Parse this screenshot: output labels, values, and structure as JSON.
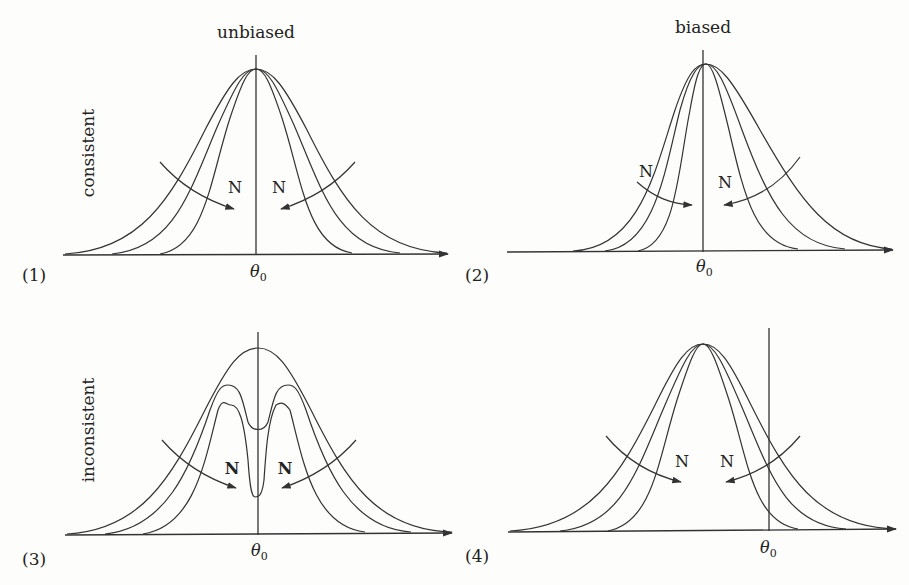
{
  "columns": {
    "left": "unbiased",
    "right": "biased"
  },
  "rows": {
    "top": "consistent",
    "bottom": "inconsistent"
  },
  "panels": [
    {
      "id": "(1)",
      "x_label": "θ",
      "x_sub": "0",
      "left_arrow_label": "N",
      "right_arrow_label": "N",
      "description": "unbiased, consistent: symmetric curves centered at θ0 narrowing as N increases"
    },
    {
      "id": "(2)",
      "x_label": "θ",
      "x_sub": "0",
      "left_arrow_label": "N",
      "right_arrow_label": "N",
      "description": "biased, consistent: skewed curves concentrating toward θ0 as N increases"
    },
    {
      "id": "(3)",
      "x_label": "θ",
      "x_sub": "0",
      "left_arrow_label": "N",
      "right_arrow_label": "N",
      "description": "unbiased, inconsistent: curves develop a dip at θ0 as N increases"
    },
    {
      "id": "(4)",
      "x_label": "θ",
      "x_sub": "0",
      "left_arrow_label": "N",
      "right_arrow_label": "N",
      "description": "biased, inconsistent: curves concentrate around a point offset from θ0"
    }
  ]
}
